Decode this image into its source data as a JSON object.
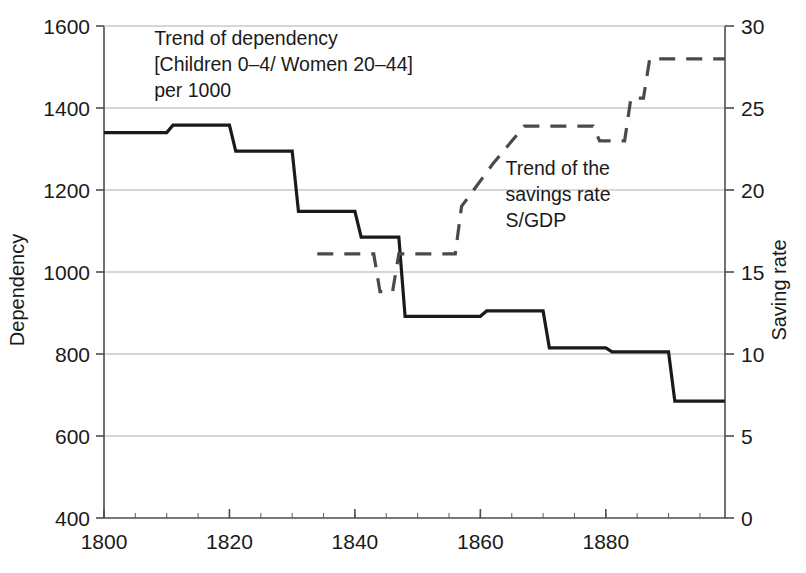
{
  "chart_data": {
    "type": "line",
    "title": "",
    "subtitle": "",
    "xlabel": "",
    "ylabel": "Dependency",
    "y2label": "Saving rate",
    "xlim": [
      1800,
      1899
    ],
    "ylim": [
      400,
      1600
    ],
    "y2lim": [
      0,
      30
    ],
    "grid": true,
    "legend_position": "inline-annotations",
    "x_ticks": [
      1800,
      1820,
      1840,
      1860,
      1880
    ],
    "x_tick_labels": [
      "1800",
      "1820",
      "1840",
      "1860",
      "1880"
    ],
    "x_minor_tick_step": 5,
    "y_ticks": [
      400,
      600,
      800,
      1000,
      1200,
      1400,
      1600
    ],
    "y_tick_labels": [
      "400",
      "600",
      "800",
      "1000",
      "1200",
      "1400",
      "1600"
    ],
    "y2_ticks": [
      0,
      5,
      10,
      15,
      20,
      25,
      30
    ],
    "y2_tick_labels": [
      "0",
      "5",
      "10",
      "15",
      "20",
      "25",
      "30"
    ],
    "series": [
      {
        "name": "Trend of dependency",
        "axis": "left",
        "style": "solid",
        "color": "#1a1a1a",
        "width": 3.2,
        "step": true,
        "points": [
          {
            "x": 1800,
            "y": 1340
          },
          {
            "x": 1810,
            "y": 1340
          },
          {
            "x": 1811,
            "y": 1358
          },
          {
            "x": 1820,
            "y": 1358
          },
          {
            "x": 1821,
            "y": 1295
          },
          {
            "x": 1830,
            "y": 1295
          },
          {
            "x": 1831,
            "y": 1148
          },
          {
            "x": 1840,
            "y": 1148
          },
          {
            "x": 1841,
            "y": 1085
          },
          {
            "x": 1847,
            "y": 1085
          },
          {
            "x": 1848,
            "y": 892
          },
          {
            "x": 1860,
            "y": 892
          },
          {
            "x": 1861,
            "y": 905
          },
          {
            "x": 1870,
            "y": 905
          },
          {
            "x": 1871,
            "y": 815
          },
          {
            "x": 1880,
            "y": 815
          },
          {
            "x": 1881,
            "y": 805
          },
          {
            "x": 1890,
            "y": 805
          },
          {
            "x": 1891,
            "y": 685
          },
          {
            "x": 1899,
            "y": 685
          }
        ]
      },
      {
        "name": "Trend of the savings rate S/GDP",
        "axis": "right",
        "style": "dashed",
        "color": "#4a4a4a",
        "width": 3.2,
        "step": true,
        "points": [
          {
            "x": 1834,
            "y": 16.1
          },
          {
            "x": 1843,
            "y": 16.1
          },
          {
            "x": 1844,
            "y": 13.8
          },
          {
            "x": 1846,
            "y": 13.8
          },
          {
            "x": 1847,
            "y": 16.1
          },
          {
            "x": 1856,
            "y": 16.1
          },
          {
            "x": 1857,
            "y": 19.0
          },
          {
            "x": 1862,
            "y": 21.6
          },
          {
            "x": 1867,
            "y": 23.9
          },
          {
            "x": 1878,
            "y": 23.9
          },
          {
            "x": 1879,
            "y": 23.0
          },
          {
            "x": 1883,
            "y": 23.0
          },
          {
            "x": 1884,
            "y": 25.6
          },
          {
            "x": 1886,
            "y": 25.6
          },
          {
            "x": 1887,
            "y": 28.0
          },
          {
            "x": 1899,
            "y": 28.0
          }
        ]
      }
    ],
    "annotations": [
      {
        "name": "dependency-annotation",
        "lines": [
          "Trend of dependency",
          "[Children 0–4/ Women 20–44]",
          "per 1000"
        ],
        "x": 1808,
        "y_px": 45
      },
      {
        "name": "savings-annotation",
        "lines": [
          "Trend of the",
          "savings rate",
          "S/GDP"
        ],
        "x": 1864,
        "y_px": 175
      }
    ]
  },
  "axes": {
    "left_title": "Dependency",
    "right_title": "Saving rate"
  },
  "colors": {
    "line_solid": "#1a1a1a",
    "line_dashed": "#4a4a4a",
    "grid": "#b0b0b0",
    "axis": "#4d4d4d",
    "background": "#ffffff"
  }
}
